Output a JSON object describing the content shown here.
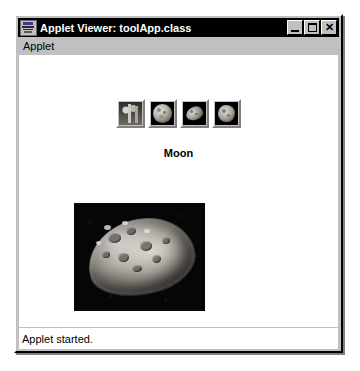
{
  "window": {
    "title": "Applet Viewer: toolApp.class",
    "icon": "applet-viewer-icon",
    "buttons": {
      "minimize": {
        "name": "minimize-button",
        "glyph": "_"
      },
      "maximize": {
        "name": "maximize-button",
        "glyph": "□"
      },
      "close": {
        "name": "close-button",
        "glyph": "✕"
      }
    }
  },
  "menubar": {
    "items": [
      {
        "label": "Applet"
      }
    ]
  },
  "applet": {
    "thumbnails": [
      {
        "name": "thumbnail-button-1",
        "alt": "rock-formation-thumbnail"
      },
      {
        "name": "thumbnail-button-2",
        "alt": "full-globe-thumbnail"
      },
      {
        "name": "thumbnail-button-3",
        "alt": "irregular-moon-thumbnail"
      },
      {
        "name": "thumbnail-button-4",
        "alt": "cratered-moon-thumbnail"
      }
    ],
    "selected_label": "Moon",
    "main_image_alt": "cratered-moon-image"
  },
  "statusbar": {
    "text": "Applet started."
  },
  "colors": {
    "window_face": "#c0c0c0",
    "titlebar": "#000000",
    "titlebar_text": "#ffffff",
    "canvas": "#ffffff",
    "image_background": "#000000"
  }
}
